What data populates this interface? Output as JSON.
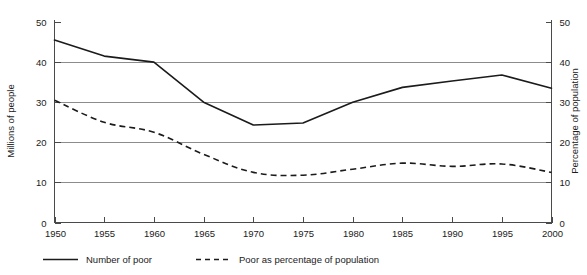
{
  "chart_data": {
    "type": "line",
    "title": "",
    "xlabel": "",
    "ylabel": "Millions of people",
    "y2label": "Percentage of population",
    "x": [
      1950,
      1955,
      1960,
      1965,
      1970,
      1975,
      1980,
      1985,
      1990,
      1995,
      2000
    ],
    "xtick_labels": [
      "1950",
      "1955",
      "1960",
      "1965",
      "1970",
      "1975",
      "1980",
      "1985",
      "1990",
      "1995",
      "2000"
    ],
    "xlim": [
      1950,
      2000
    ],
    "ylim": [
      0,
      50
    ],
    "y2lim": [
      0,
      50
    ],
    "ytick_labels": [
      "0",
      "10",
      "20",
      "30",
      "40",
      "50"
    ],
    "ytick_values": [
      0,
      10,
      20,
      30,
      40,
      50
    ],
    "y2tick_labels": [
      "0",
      "10",
      "20",
      "30",
      "40",
      "50"
    ],
    "y2tick_values": [
      0,
      10,
      20,
      30,
      40,
      50
    ],
    "grid": true,
    "grid_values": [
      10,
      20,
      30,
      40
    ],
    "legend_position": "bottom",
    "series": [
      {
        "name": "Number of poor",
        "style": "solid",
        "axis": "left",
        "color": "#1b1b1b",
        "values": [
          45.5,
          41.5,
          40.0,
          30.0,
          24.3,
          24.8,
          30.0,
          33.7,
          35.3,
          36.8,
          33.5
        ]
      },
      {
        "name": "Poor as percentage of population",
        "style": "dashed",
        "axis": "right",
        "color": "#1b1b1b",
        "values": [
          30.5,
          25.0,
          22.5,
          17.0,
          12.5,
          11.8,
          13.3,
          14.8,
          14.0,
          14.6,
          12.5
        ]
      }
    ]
  },
  "legend": {
    "items": [
      {
        "label": "Number of poor",
        "style": "solid"
      },
      {
        "label": "Poor as percentage of population",
        "style": "dashed"
      }
    ]
  },
  "axes": {
    "left_title": "Millions of people",
    "right_title": "Percentage of population"
  }
}
